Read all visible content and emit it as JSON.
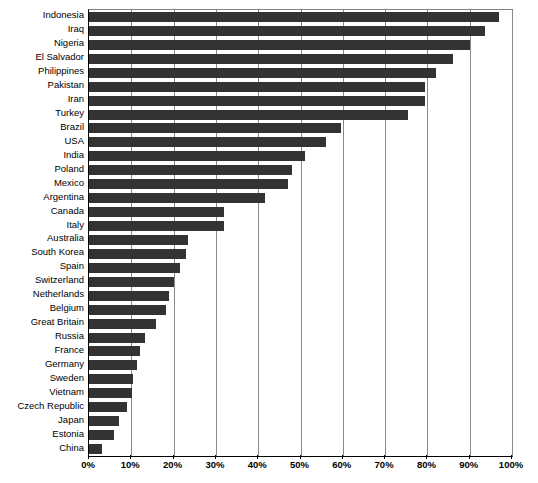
{
  "chart_data": {
    "type": "bar",
    "orientation": "horizontal",
    "title": "",
    "subtitle": "",
    "xlabel": "",
    "ylabel": "",
    "xlim": [
      0,
      100
    ],
    "xtick_labels": [
      "0%",
      "10%",
      "20%",
      "30%",
      "40%",
      "50%",
      "60%",
      "70%",
      "80%",
      "90%",
      "100%"
    ],
    "xtick_values": [
      0,
      10,
      20,
      30,
      40,
      50,
      60,
      70,
      80,
      90,
      100
    ],
    "grid": true,
    "grid_axis": "x",
    "legend": false,
    "bar_color": "#333333",
    "axis_color": "#000000",
    "gridline_color": "#8a8a8a",
    "categories": [
      "Indonesia",
      "Iraq",
      "Nigeria",
      "El Salvador",
      "Philippines",
      "Pakistan",
      "Iran",
      "Turkey",
      "Brazil",
      "USA",
      "India",
      "Poland",
      "Mexico",
      "Argentina",
      "Canada",
      "Italy",
      "Australia",
      "South Korea",
      "Spain",
      "Switzerland",
      "Netherlands",
      "Belgium",
      "Great Britain",
      "Russia",
      "France",
      "Germany",
      "Sweden",
      "Vietnam",
      "Czech Republic",
      "Japan",
      "Estonia",
      "China"
    ],
    "values": [
      97,
      93.5,
      90,
      86,
      82,
      79.5,
      79.5,
      75.5,
      59.5,
      56,
      51,
      48,
      47,
      41.5,
      32,
      32,
      23.5,
      23,
      21.5,
      20,
      19,
      18.3,
      15.8,
      13.3,
      12,
      11.3,
      10.5,
      10.2,
      8.9,
      7.1,
      6,
      3
    ],
    "unit": "%"
  }
}
